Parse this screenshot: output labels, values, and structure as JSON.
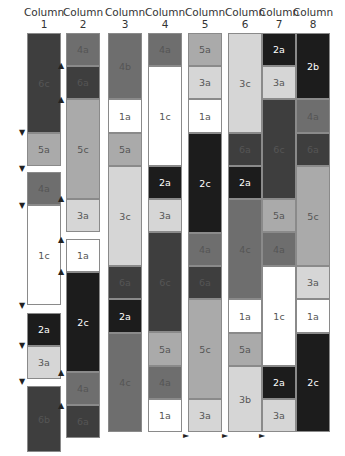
{
  "palette": {
    "1": "#ffffff",
    "2": "#1c1c1c",
    "3": "#d6d6d6",
    "4": "#6e6e6e",
    "5": "#aaaaaa",
    "6": "#3e3e3e"
  },
  "columns": [
    {
      "title": "Column",
      "number": "1",
      "x": 27,
      "blocks": [
        {
          "label": "6c",
          "y0": 33,
          "y1": 133
        },
        {
          "label": "5a",
          "y0": 133,
          "y1": 166
        },
        {
          "label": "4a",
          "y0": 172,
          "y1": 205
        },
        {
          "label": "1c",
          "y0": 205,
          "y1": 305
        },
        {
          "label": "2a",
          "y0": 313,
          "y1": 346
        },
        {
          "label": "3a",
          "y0": 346,
          "y1": 379
        },
        {
          "label": "6b",
          "y0": 386,
          "y1": 452
        }
      ]
    },
    {
      "title": "Column",
      "number": "2",
      "x": 66,
      "blocks": [
        {
          "label": "4a",
          "y0": 33,
          "y1": 66
        },
        {
          "label": "6a",
          "y0": 66,
          "y1": 99
        },
        {
          "label": "5c",
          "y0": 99,
          "y1": 199
        },
        {
          "label": "3a",
          "y0": 199,
          "y1": 232
        },
        {
          "label": "1a",
          "y0": 239,
          "y1": 272
        },
        {
          "label": "2c",
          "y0": 272,
          "y1": 372
        },
        {
          "label": "4a",
          "y0": 372,
          "y1": 405
        },
        {
          "label": "6a",
          "y0": 405,
          "y1": 438
        }
      ]
    },
    {
      "title": "Column",
      "number": "3",
      "x": 108,
      "blocks": [
        {
          "label": "4b",
          "y0": 33,
          "y1": 99
        },
        {
          "label": "1a",
          "y0": 99,
          "y1": 133
        },
        {
          "label": "5a",
          "y0": 133,
          "y1": 166
        },
        {
          "label": "3c",
          "y0": 166,
          "y1": 266
        },
        {
          "label": "6a",
          "y0": 266,
          "y1": 299
        },
        {
          "label": "2a",
          "y0": 299,
          "y1": 333
        },
        {
          "label": "4c",
          "y0": 333,
          "y1": 432
        }
      ]
    },
    {
      "title": "Column",
      "number": "4",
      "x": 148,
      "blocks": [
        {
          "label": "4a",
          "y0": 33,
          "y1": 66
        },
        {
          "label": "1c",
          "y0": 66,
          "y1": 166
        },
        {
          "label": "2a",
          "y0": 166,
          "y1": 199
        },
        {
          "label": "3a",
          "y0": 199,
          "y1": 232
        },
        {
          "label": "6c",
          "y0": 232,
          "y1": 332
        },
        {
          "label": "5a",
          "y0": 332,
          "y1": 366
        },
        {
          "label": "4a",
          "y0": 366,
          "y1": 399
        },
        {
          "label": "1a",
          "y0": 399,
          "y1": 432
        }
      ]
    },
    {
      "title": "Column",
      "number": "5",
      "x": 188,
      "blocks": [
        {
          "label": "5a",
          "y0": 33,
          "y1": 66
        },
        {
          "label": "3a",
          "y0": 66,
          "y1": 99
        },
        {
          "label": "1a",
          "y0": 99,
          "y1": 133
        },
        {
          "label": "2c",
          "y0": 133,
          "y1": 233
        },
        {
          "label": "4a",
          "y0": 233,
          "y1": 266
        },
        {
          "label": "6a",
          "y0": 266,
          "y1": 299
        },
        {
          "label": "5c",
          "y0": 299,
          "y1": 399
        },
        {
          "label": "3a",
          "y0": 399,
          "y1": 432
        }
      ]
    },
    {
      "title": "Column",
      "number": "6",
      "x": 228,
      "blocks": [
        {
          "label": "3c",
          "y0": 33,
          "y1": 133
        },
        {
          "label": "6a",
          "y0": 133,
          "y1": 166
        },
        {
          "label": "2a",
          "y0": 166,
          "y1": 199
        },
        {
          "label": "4c",
          "y0": 199,
          "y1": 299
        },
        {
          "label": "1a",
          "y0": 299,
          "y1": 333
        },
        {
          "label": "5a",
          "y0": 333,
          "y1": 366
        },
        {
          "label": "3b",
          "y0": 366,
          "y1": 432
        }
      ]
    },
    {
      "title": "Column",
      "number": "7",
      "x": 262,
      "blocks": [
        {
          "label": "2a",
          "y0": 33,
          "y1": 66
        },
        {
          "label": "3a",
          "y0": 66,
          "y1": 99
        },
        {
          "label": "6c",
          "y0": 99,
          "y1": 199
        },
        {
          "label": "5a",
          "y0": 199,
          "y1": 232
        },
        {
          "label": "4a",
          "y0": 232,
          "y1": 266
        },
        {
          "label": "1c",
          "y0": 266,
          "y1": 366
        },
        {
          "label": "2a",
          "y0": 366,
          "y1": 399
        },
        {
          "label": "3a",
          "y0": 399,
          "y1": 432
        }
      ]
    },
    {
      "title": "Column",
      "number": "8",
      "x": 296,
      "blocks": [
        {
          "label": "2b",
          "y0": 33,
          "y1": 99
        },
        {
          "label": "4a",
          "y0": 99,
          "y1": 133
        },
        {
          "label": "6a",
          "y0": 133,
          "y1": 166
        },
        {
          "label": "5c",
          "y0": 166,
          "y1": 266
        },
        {
          "label": "3a",
          "y0": 266,
          "y1": 299
        },
        {
          "label": "1a",
          "y0": 299,
          "y1": 333
        },
        {
          "label": "2c",
          "y0": 333,
          "y1": 432
        }
      ]
    }
  ],
  "arrows": {
    "down_col1": {
      "x": 22,
      "ys": [
        129,
        165,
        202,
        302,
        342,
        378
      ]
    },
    "up_col2": {
      "x": 61,
      "ys": [
        62,
        96,
        195,
        236,
        268,
        369,
        402
      ]
    },
    "right_bottom": {
      "y": 432,
      "xs": [
        183,
        222,
        259
      ]
    },
    "down_glyph": "▼",
    "up_glyph": "▲",
    "right_glyph": "►"
  }
}
